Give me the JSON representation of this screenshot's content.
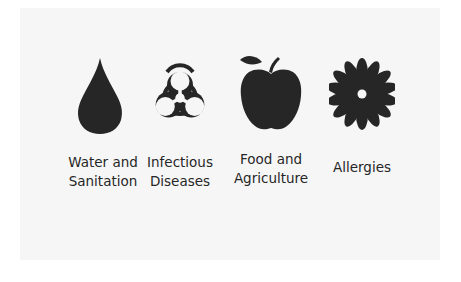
{
  "figure": {
    "items": [
      {
        "icon": "water-drop-icon",
        "label_line1": "Water and",
        "label_line2": "Sanitation"
      },
      {
        "icon": "biohazard-icon",
        "label_line1": "Infectious",
        "label_line2": "Diseases"
      },
      {
        "icon": "apple-icon",
        "label_line1": "Food and",
        "label_line2": "Agriculture"
      },
      {
        "icon": "flower-icon",
        "label_line1": "Allergies",
        "label_line2": ""
      }
    ],
    "icon_color": "#262626",
    "background_color": "#f6f6f6"
  }
}
